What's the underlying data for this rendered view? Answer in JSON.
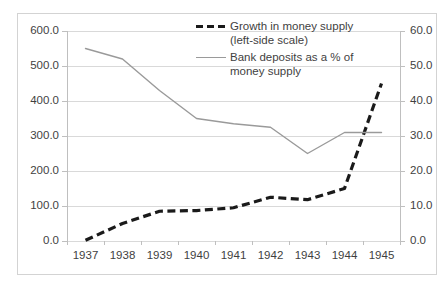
{
  "chart_data": {
    "type": "line",
    "title": "",
    "xlabel": "",
    "ylabel": "",
    "categories": [
      "1937",
      "1938",
      "1939",
      "1940",
      "1941",
      "1942",
      "1943",
      "1944",
      "1945"
    ],
    "grid": true,
    "legend_position": "top-center",
    "axes": {
      "left": {
        "label": "",
        "ylim": [
          0.0,
          600.0
        ],
        "tick_step": 100.0,
        "ticks": [
          "0.0",
          "100.0",
          "200.0",
          "300.0",
          "400.0",
          "500.0",
          "600.0"
        ]
      },
      "right": {
        "label": "",
        "ylim": [
          0.0,
          60.0
        ],
        "tick_step": 10.0,
        "ticks": [
          "0.0",
          "10.0",
          "20.0",
          "30.0",
          "40.0",
          "50.0",
          "60.0"
        ]
      }
    },
    "series": [
      {
        "name": "Growth in money supply (left-side scale)",
        "axis": "left",
        "style": "dashed",
        "color": "#1a1a1a",
        "values": [
          2,
          50,
          85,
          87,
          95,
          125,
          118,
          150,
          450
        ]
      },
      {
        "name": "Bank deposits as a % of money supply",
        "axis": "right",
        "style": "solid",
        "color": "#9a9a9a",
        "values": [
          55.0,
          52.0,
          43.0,
          35.0,
          33.5,
          32.5,
          25.0,
          31.0,
          31.0
        ]
      }
    ]
  },
  "legend": {
    "entries": [
      {
        "label": "Growth in money supply (left-side scale)",
        "swatch": "dashed-line-swatch"
      },
      {
        "label": "Bank deposits as a % of money supply",
        "swatch": "solid-line-swatch"
      }
    ]
  },
  "colors": {
    "dashed_series": "#1a1a1a",
    "solid_series": "#9a9a9a",
    "gridline": "#d9d9d9",
    "axis": "#bfbfbf",
    "text": "#3f3f3f",
    "frame": "#d3d3d3",
    "background": "#ffffff"
  }
}
